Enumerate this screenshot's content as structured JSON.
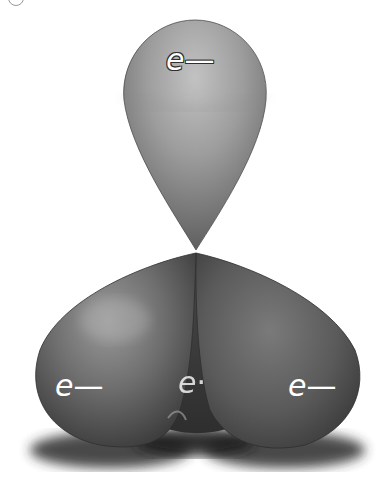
{
  "diagram": {
    "labels": [
      {
        "id": "top",
        "text_e": "e",
        "text_sign": "—"
      },
      {
        "id": "left",
        "text_e": "e",
        "text_sign": "—"
      },
      {
        "id": "center",
        "text_e": "e",
        "text_sign": "·"
      },
      {
        "id": "right",
        "text_e": "e",
        "text_sign": "—"
      }
    ],
    "colors": {
      "background": "#ffffff",
      "top_lobe_light": "#b5b5b5",
      "top_lobe_dark": "#6a6a6a",
      "bottom_lobe_light": "#8a8a8a",
      "bottom_lobe_dark": "#3a3a3a",
      "shadow": "#2a2a2a",
      "label": "#ffffff"
    }
  }
}
